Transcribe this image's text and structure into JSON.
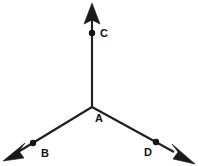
{
  "figure": {
    "type": "geometry-diagram",
    "width": 198,
    "height": 166,
    "background_color": "#ffffff",
    "line_color": "#201f1f",
    "label_color": "#111111",
    "vertex": {
      "label": "A",
      "x": 92,
      "y": 107,
      "label_x": 95,
      "label_y": 121
    },
    "rays": [
      {
        "name": "ray-AC",
        "direction": "up",
        "from_x": 92,
        "from_y": 107,
        "to_x": 92,
        "to_y": 18,
        "arrow_tip_x": 92,
        "arrow_tip_y": 3,
        "point": {
          "label": "C",
          "x": 92,
          "y": 33,
          "label_x": 100,
          "label_y": 37
        }
      },
      {
        "name": "ray-AB",
        "direction": "down-left",
        "from_x": 92,
        "from_y": 107,
        "to_x": 17,
        "to_y": 152,
        "arrow_tip_x": 4,
        "arrow_tip_y": 160,
        "point": {
          "label": "B",
          "x": 33,
          "y": 143,
          "label_x": 41,
          "label_y": 156
        }
      },
      {
        "name": "ray-AD",
        "direction": "down-right",
        "from_x": 92,
        "from_y": 107,
        "to_x": 172,
        "to_y": 151,
        "arrow_tip_x": 194,
        "arrow_tip_y": 162,
        "point": {
          "label": "D",
          "x": 156,
          "y": 142,
          "label_x": 148,
          "label_y": 156
        }
      }
    ],
    "labels": {
      "vertex": "A",
      "up": "C",
      "down_left": "B",
      "down_right": "D"
    }
  }
}
